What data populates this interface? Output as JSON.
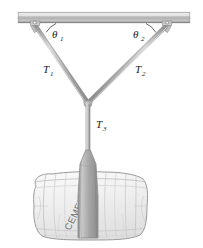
{
  "figure": {
    "background_color": "#ffffff"
  },
  "beam": {
    "name": "ceiling-beam",
    "color_light": "#e4e4e4",
    "color_mid": "#b6b6b6",
    "color_dark": "#8f8f8f",
    "x": 18,
    "y": 12,
    "width": 172,
    "height": 11
  },
  "ropes": {
    "color": "#a9a9a9",
    "highlight": "#d8d8d8",
    "shadow": "#8b8b8b",
    "left": {
      "label": "T",
      "subscript": "1",
      "anchor_x": 34,
      "anchor_y": 25,
      "knot_x": 88,
      "knot_y": 103
    },
    "right": {
      "label": "T",
      "subscript": "2",
      "anchor_x": 168,
      "anchor_y": 25,
      "knot_x": 88,
      "knot_y": 103
    },
    "vertical": {
      "label": "T",
      "subscript": "3",
      "knot_x": 88,
      "knot_y": 103,
      "end_y": 150
    }
  },
  "angles": {
    "left": {
      "label": "θ",
      "subscript": "1"
    },
    "right": {
      "label": "θ",
      "subscript": "2"
    },
    "arc_color": "#3a3a3a"
  },
  "bag": {
    "name": "cement-bag",
    "text": "CEMENT",
    "fill": "#f1f1f1",
    "stroke": "#9a9a9a",
    "text_color": "#6f6f6f",
    "x": 30,
    "y": 172,
    "width": 116,
    "height": 68
  },
  "strap": {
    "name": "lifting-strap",
    "fill": "#b0b0b0",
    "stroke": "#8a8a8a"
  }
}
